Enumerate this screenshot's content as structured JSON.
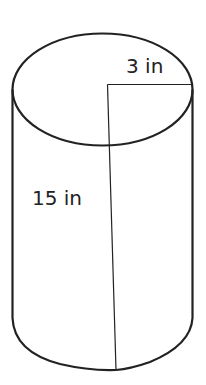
{
  "diagram": {
    "type": "cylinder",
    "labels": {
      "radius": "3 in",
      "height": "15 in"
    },
    "dimensions": {
      "radius_value": 3,
      "height_value": 15,
      "unit": "in"
    },
    "colors": {
      "stroke": "#222222",
      "background": "#ffffff"
    }
  }
}
